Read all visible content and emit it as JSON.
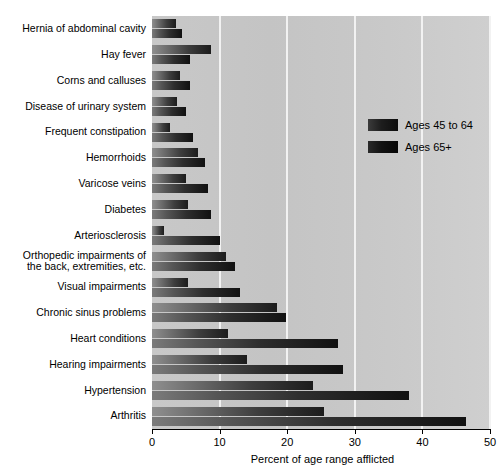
{
  "chart_data": {
    "type": "bar",
    "orientation": "horizontal",
    "title": "",
    "xlabel": "Percent of age range afflicted",
    "ylabel": "",
    "xlim": [
      0,
      50
    ],
    "xticks": [
      0,
      10,
      20,
      30,
      40,
      50
    ],
    "xtick_labels": [
      "0",
      "10",
      "20",
      "30",
      "40",
      "50"
    ],
    "grid": true,
    "grid_axis": "x",
    "legend_position": "upper right",
    "categories": [
      "Hernia of abdominal cavity",
      "Hay fever",
      "Corns and calluses",
      "Disease of urinary system",
      "Frequent constipation",
      "Hemorrhoids",
      "Varicose veins",
      "Diabetes",
      "Arteriosclerosis",
      "Orthopedic impairments of\nthe back, extremities, etc.",
      "Visual impairments",
      "Chronic sinus problems",
      "Heart conditions",
      "Hearing impairments",
      "Hypertension",
      "Arthritis"
    ],
    "series": [
      {
        "name": "Ages 45 to 64",
        "color": "#2b2b2b",
        "values": [
          3.5,
          8.7,
          4.2,
          3.7,
          2.6,
          6.8,
          5.1,
          5.3,
          1.8,
          11.0,
          5.3,
          18.5,
          11.3,
          14.0,
          23.8,
          25.5
        ]
      },
      {
        "name": "Ages 65+",
        "color": "#111111",
        "values": [
          4.5,
          5.6,
          5.6,
          5.0,
          6.0,
          7.8,
          8.3,
          8.8,
          10.0,
          12.3,
          13.0,
          19.8,
          27.5,
          28.3,
          38.0,
          46.5
        ]
      }
    ]
  },
  "legend": {
    "items": [
      {
        "label": "Ages 45 to 64",
        "swatch": "legend-swatch-ages-45-64"
      },
      {
        "label": "Ages 65+",
        "swatch": "legend-swatch-ages-65-plus"
      }
    ]
  },
  "axis": {
    "x_title": "Percent of age range afflicted"
  }
}
